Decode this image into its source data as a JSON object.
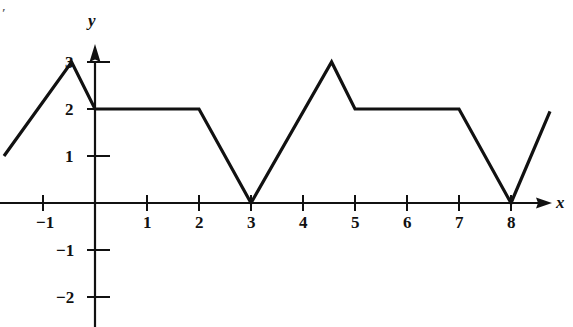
{
  "figure": {
    "title": "",
    "background_color": "#ffffff",
    "line_color": "#111111",
    "axis_color": "#111111",
    "stray_mark": "′"
  },
  "axes": {
    "x_axis_name": "x",
    "y_axis_name": "y",
    "x_tick_labels": [
      "−1",
      "1",
      "2",
      "3",
      "4",
      "5",
      "6",
      "7",
      "8"
    ],
    "y_tick_labels": [
      "3",
      "2",
      "1",
      "−1",
      "−2"
    ]
  },
  "chart_data": {
    "type": "line",
    "title": "",
    "xlabel": "x",
    "ylabel": "y",
    "xlim": [
      -1.9,
      9.2
    ],
    "ylim": [
      -2.6,
      3.3
    ],
    "grid": false,
    "legend": null,
    "x_ticks": [
      -1,
      1,
      2,
      3,
      4,
      5,
      6,
      7,
      8
    ],
    "y_ticks": [
      3,
      2,
      1,
      -1,
      -2
    ],
    "series": [
      {
        "name": "f(x)",
        "x": [
          -1.75,
          -0.45,
          0,
          2,
          3,
          4.55,
          5,
          7,
          8,
          8.75
        ],
        "y": [
          1,
          3,
          2,
          2,
          0,
          3,
          2,
          2,
          0,
          1.95
        ]
      }
    ]
  }
}
